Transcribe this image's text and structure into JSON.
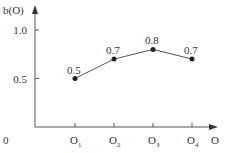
{
  "chart_data": {
    "type": "line",
    "title": "",
    "xlabel": "O",
    "ylabel": "b(O)",
    "origin_label": "0",
    "categories": [
      "O1",
      "O2",
      "O3",
      "O4"
    ],
    "category_display": [
      {
        "base": "O",
        "sub": "1"
      },
      {
        "base": "O",
        "sub": "2"
      },
      {
        "base": "O",
        "sub": "3"
      },
      {
        "base": "O",
        "sub": "4"
      }
    ],
    "values": [
      0.5,
      0.7,
      0.8,
      0.7
    ],
    "data_labels": [
      "0.5",
      "0.7",
      "0.8",
      "0.7"
    ],
    "yticks": [
      {
        "value": 0.5,
        "label": "0.5"
      },
      {
        "value": 1.0,
        "label": "1.0"
      }
    ],
    "ylim": [
      0,
      1.1
    ],
    "grid": false,
    "legend": null,
    "colors": {
      "line": "#555555",
      "marker": "#222222",
      "axis": "#555555",
      "text": "#333333"
    }
  }
}
